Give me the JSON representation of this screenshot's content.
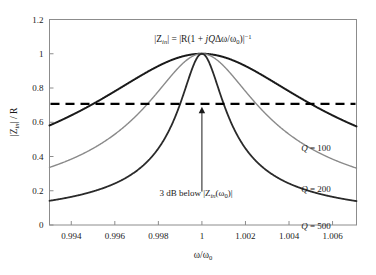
{
  "chart_data": {
    "type": "line",
    "title": "",
    "equation_annotation": "|Z in| = |R(1 + jQΔω/ω₀)|⁻¹",
    "xlabel": "ω/ω₀",
    "ylabel": "|Z in| / R",
    "xlim": [
      0.993,
      1.0071
    ],
    "ylim": [
      0,
      1.2
    ],
    "grid": false,
    "legend_position": "inline-right",
    "xticks": [
      "0.994",
      "0.996",
      "0.998",
      "1",
      "1.002",
      "1.004",
      "1.006"
    ],
    "xtick_values": [
      0.994,
      0.996,
      0.998,
      1.0,
      1.002,
      1.004,
      1.006
    ],
    "yticks": [
      "0",
      "0.2",
      "0.4",
      "0.6",
      "0.8",
      "1",
      "1.2"
    ],
    "ytick_values": [
      0,
      0.2,
      0.4,
      0.6,
      0.8,
      1.0,
      1.2
    ],
    "series": [
      {
        "name": "Q = 100",
        "q": 100,
        "color": "#1a1a1a",
        "width": 2.0,
        "label": "Q = 100",
        "label_x": 1.0045,
        "label_y": 0.545,
        "endpoint_left": 0.59,
        "endpoint_right": 0.6,
        "peak": 1.0
      },
      {
        "name": "Q = 200",
        "q": 200,
        "color": "#8a8a8a",
        "width": 1.4,
        "label": "Q = 200",
        "label_x": 1.0045,
        "label_y": 0.305,
        "endpoint_left": 0.335,
        "endpoint_right": 0.345,
        "peak": 1.0
      },
      {
        "name": "Q = 500",
        "q": 500,
        "color": "#2a2a2a",
        "width": 1.8,
        "label": "Q = 500",
        "label_x": 1.0045,
        "label_y": 0.085,
        "endpoint_left": 0.14,
        "endpoint_right": 0.15,
        "peak": 1.0
      }
    ],
    "reference_line": {
      "name": "3 dB line",
      "y": 0.7071,
      "style": "dashed",
      "color": "#000000",
      "width": 2.2
    },
    "annotations": [
      {
        "name": "three-db-annotation",
        "text": "3 dB below |Z in(ω₀)|",
        "text_x": 1.0,
        "text_y": 0.14,
        "arrow_from_y": 0.195,
        "arrow_to_y": 0.69
      }
    ]
  },
  "labels": {
    "eq_zin": "|Z",
    "eq_sub_in": "in",
    "eq_mid": "| = |R(1 + ",
    "eq_j": "j",
    "eq_q": "Q",
    "eq_delta": "Δω/ω",
    "eq_sub_0": "0",
    "eq_close": ")|",
    "eq_sup": "−1",
    "ylabel_z": "|Z",
    "ylabel_sub": "in",
    "ylabel_tail": "| / R",
    "xlabel_w": "ω/ω",
    "xlabel_sub": "0",
    "ann_prefix": "3 dB below |Z",
    "ann_sub": "in",
    "ann_mid": "(ω",
    "ann_sub2": "0",
    "ann_suffix": ")|",
    "q_eq": "Q",
    "q_100": " = 100",
    "q_200": " = 200",
    "q_500": " = 500"
  }
}
